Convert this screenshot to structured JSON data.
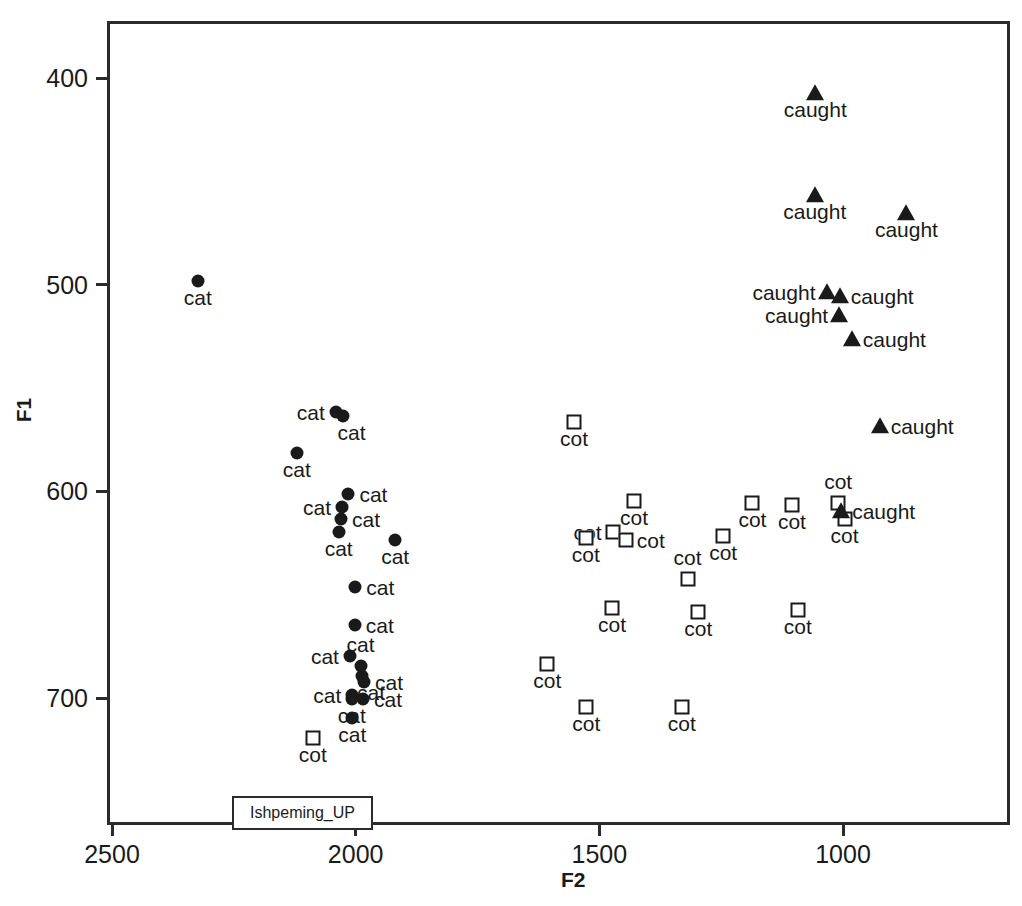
{
  "chart_data": {
    "type": "scatter",
    "title": "",
    "xlabel": "F2",
    "ylabel": "F1",
    "xlim": [
      2580,
      880
    ],
    "ylim": [
      373,
      762
    ],
    "x_ticks": [
      2500,
      2000,
      1500,
      1000
    ],
    "y_ticks": [
      400,
      500,
      600,
      700
    ],
    "x_axis_inverted": true,
    "y_axis_inverted": true,
    "grid": false,
    "legend": {
      "position": "bottom-left-inside",
      "text": "Ishpeming_UP"
    },
    "series": [
      {
        "name": "cat",
        "marker": "filled-circle",
        "color": "#1a1a1a",
        "points": [
          {
            "F2": 2330,
            "F1": 497,
            "label": "cat",
            "anchor": "below"
          },
          {
            "F2": 2047,
            "F1": 560,
            "label": "cat",
            "anchor": "left"
          },
          {
            "F2": 2033,
            "F1": 562,
            "label": "cat",
            "anchor": "belowright"
          },
          {
            "F2": 2127,
            "F1": 580,
            "label": "cat",
            "anchor": "below"
          },
          {
            "F2": 2021,
            "F1": 600,
            "label": "cat",
            "anchor": "right"
          },
          {
            "F2": 2034,
            "F1": 606,
            "label": "cat",
            "anchor": "left"
          },
          {
            "F2": 2036,
            "F1": 612,
            "label": "cat",
            "anchor": "right"
          },
          {
            "F2": 2041,
            "F1": 618,
            "label": "cat",
            "anchor": "below"
          },
          {
            "F2": 1925,
            "F1": 622,
            "label": "cat",
            "anchor": "below"
          },
          {
            "F2": 2007,
            "F1": 645,
            "label": "cat",
            "anchor": "right"
          },
          {
            "F2": 2008,
            "F1": 663,
            "label": "cat",
            "anchor": "right"
          },
          {
            "F2": 2018,
            "F1": 678,
            "label": "cat",
            "anchor": "left"
          },
          {
            "F2": 1996,
            "F1": 683,
            "label": "cat",
            "anchor": "above"
          },
          {
            "F2": 1993,
            "F1": 688,
            "label": "cat",
            "anchor": "belowright"
          },
          {
            "F2": 1989,
            "F1": 691,
            "label": "cat",
            "anchor": "right"
          },
          {
            "F2": 2013,
            "F1": 697,
            "label": "cat",
            "anchor": "left"
          },
          {
            "F2": 2014,
            "F1": 699,
            "label": "cat",
            "anchor": "below"
          },
          {
            "F2": 1991,
            "F1": 699,
            "label": "cat",
            "anchor": "right"
          },
          {
            "F2": 2013,
            "F1": 708,
            "label": "cat",
            "anchor": "below"
          }
        ]
      },
      {
        "name": "cot",
        "marker": "open-square",
        "color": "#1a1a1a",
        "points": [
          {
            "F2": 1558,
            "F1": 565,
            "label": "cot",
            "anchor": "below"
          },
          {
            "F2": 1435,
            "F1": 603,
            "label": "cot",
            "anchor": "below"
          },
          {
            "F2": 1192,
            "F1": 604,
            "label": "cot",
            "anchor": "below"
          },
          {
            "F2": 1111,
            "F1": 605,
            "label": "cot",
            "anchor": "below"
          },
          {
            "F2": 1016,
            "F1": 604,
            "label": "cot",
            "anchor": "above"
          },
          {
            "F2": 1003,
            "F1": 612,
            "label": "cot",
            "anchor": "below"
          },
          {
            "F2": 1479,
            "F1": 618,
            "label": "cot",
            "anchor": "left"
          },
          {
            "F2": 1452,
            "F1": 622,
            "label": "cot",
            "anchor": "right"
          },
          {
            "F2": 1534,
            "F1": 621,
            "label": "cot",
            "anchor": "below"
          },
          {
            "F2": 1252,
            "F1": 620,
            "label": "cot",
            "anchor": "below"
          },
          {
            "F2": 1325,
            "F1": 641,
            "label": "cot",
            "anchor": "above"
          },
          {
            "F2": 1480,
            "F1": 655,
            "label": "cot",
            "anchor": "below"
          },
          {
            "F2": 1303,
            "F1": 657,
            "label": "cot",
            "anchor": "below"
          },
          {
            "F2": 1099,
            "F1": 656,
            "label": "cot",
            "anchor": "below"
          },
          {
            "F2": 1613,
            "F1": 682,
            "label": "cot",
            "anchor": "below"
          },
          {
            "F2": 2094,
            "F1": 718,
            "label": "cot",
            "anchor": "below"
          },
          {
            "F2": 1533,
            "F1": 703,
            "label": "cot",
            "anchor": "below"
          },
          {
            "F2": 1337,
            "F1": 703,
            "label": "cot",
            "anchor": "below"
          }
        ]
      },
      {
        "name": "caught",
        "marker": "filled-triangle",
        "color": "#1a1a1a",
        "points": [
          {
            "F2": 1063,
            "F1": 406,
            "label": "caught",
            "anchor": "below"
          },
          {
            "F2": 1064,
            "F1": 455,
            "label": "caught",
            "anchor": "below"
          },
          {
            "F2": 876,
            "F1": 464,
            "label": "caught",
            "anchor": "below"
          },
          {
            "F2": 1040,
            "F1": 502,
            "label": "caught",
            "anchor": "left"
          },
          {
            "F2": 1013,
            "F1": 504,
            "label": "caught",
            "anchor": "right"
          },
          {
            "F2": 1014,
            "F1": 513,
            "label": "caught",
            "anchor": "left"
          },
          {
            "F2": 988,
            "F1": 525,
            "label": "caught",
            "anchor": "right"
          },
          {
            "F2": 931,
            "F1": 567,
            "label": "caught",
            "anchor": "right"
          },
          {
            "F2": 1010,
            "F1": 608,
            "label": "caught",
            "anchor": "right"
          }
        ]
      }
    ]
  }
}
